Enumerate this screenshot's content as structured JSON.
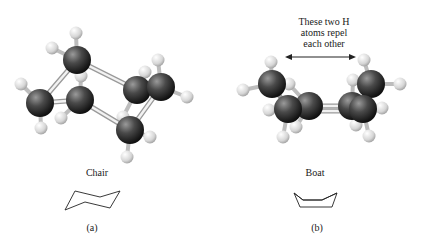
{
  "figure": {
    "panels": [
      {
        "id": "a",
        "name": "Chair",
        "label": "(a)"
      },
      {
        "id": "b",
        "name": "Boat",
        "label": "(b)"
      }
    ],
    "annotation": {
      "lines": [
        "These two H",
        "atoms repel",
        "each other"
      ]
    },
    "colors": {
      "carbon": "#3a3a3a",
      "hydrogen": "#d8d8d8",
      "bond": "#e6e6e6",
      "line": "#222222"
    }
  }
}
